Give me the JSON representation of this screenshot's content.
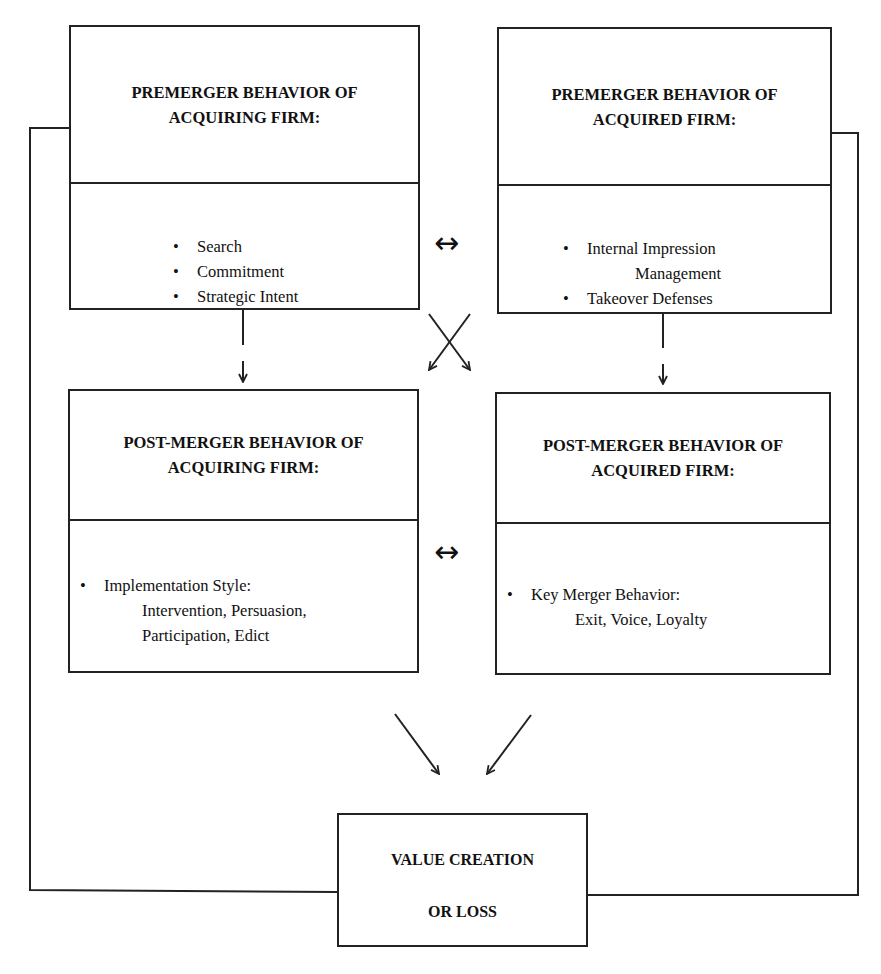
{
  "diagram": {
    "boxes": {
      "premerger_acquiring": {
        "title_line1": "PREMERGER BEHAVIOR OF",
        "title_line2": "ACQUIRING FIRM:",
        "items": [
          "Search",
          "Commitment",
          "Strategic Intent"
        ]
      },
      "premerger_acquired": {
        "title_line1": "PREMERGER BEHAVIOR OF",
        "title_line2": "ACQUIRED FIRM:",
        "items": [
          {
            "line1": "Internal Impression",
            "line2": "Management"
          },
          {
            "line1": "Takeover Defenses"
          }
        ]
      },
      "postmerger_acquiring": {
        "title_line1": "POST-MERGER BEHAVIOR OF",
        "title_line2": "ACQUIRING FIRM:",
        "item_label": "Implementation Style:",
        "item_line2": "Intervention, Persuasion,",
        "item_line3": "Participation, Edict"
      },
      "postmerger_acquired": {
        "title_line1": "POST-MERGER BEHAVIOR OF",
        "title_line2": "ACQUIRED FIRM:",
        "item_label": "Key Merger Behavior:",
        "item_line2": "Exit, Voice, Loyalty"
      },
      "outcome": {
        "line1": "VALUE CREATION",
        "line2": "OR LOSS"
      }
    },
    "connectors": [
      {
        "from": "premerger_acquiring",
        "to": "premerger_acquired",
        "type": "bidirectional",
        "glyph": "↔"
      },
      {
        "from": "postmerger_acquiring",
        "to": "postmerger_acquired",
        "type": "bidirectional",
        "glyph": "↔"
      },
      {
        "from": "premerger_acquiring",
        "to": "postmerger_acquiring",
        "type": "arrow-down"
      },
      {
        "from": "premerger_acquired",
        "to": "postmerger_acquired",
        "type": "arrow-down"
      },
      {
        "from": "premerger_acquiring",
        "to": "postmerger_acquired",
        "type": "cross-arrow"
      },
      {
        "from": "premerger_acquired",
        "to": "postmerger_acquiring",
        "type": "cross-arrow"
      },
      {
        "from": "postmerger_acquiring",
        "to": "outcome",
        "type": "arrow-diagonal"
      },
      {
        "from": "postmerger_acquired",
        "to": "outcome",
        "type": "arrow-diagonal"
      },
      {
        "from": "outcome",
        "to": "premerger_acquiring",
        "type": "feedback-loop-left"
      },
      {
        "from": "outcome",
        "to": "premerger_acquired",
        "type": "feedback-loop-right"
      }
    ]
  }
}
